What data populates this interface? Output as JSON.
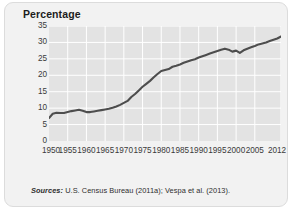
{
  "figure": {
    "title": "Percentage",
    "background_color": "#f2f2f2",
    "plot_background_color": "#e3e3e3",
    "gridline_color": "#ffffff",
    "line_color": "#4d4d4d"
  },
  "sources": {
    "label": "Sources:",
    "text": " U.S. Census Bureau (2011a); Vespa et al. (2013)."
  },
  "chart_data": {
    "type": "line",
    "title": "Percentage",
    "xlabel": "",
    "ylabel": "Percentage",
    "xlim": [
      1950,
      2012
    ],
    "ylim": [
      0,
      35
    ],
    "ytick_step": 5,
    "grid": true,
    "legend": "none",
    "ytick_labels": [
      "0",
      "5",
      "10",
      "15",
      "20",
      "25",
      "30",
      "35"
    ],
    "ytick_values": [
      0,
      5,
      10,
      15,
      20,
      25,
      30,
      35
    ],
    "xtick_labels": [
      "1950",
      "1955",
      "1960",
      "1965",
      "1970",
      "1975",
      "1980",
      "1985",
      "1990",
      "1995",
      "2000",
      "2005",
      "2012"
    ],
    "xtick_values": [
      1950,
      1955,
      1960,
      1965,
      1970,
      1975,
      1980,
      1985,
      1990,
      1995,
      2000,
      2005,
      2012
    ],
    "x": [
      1950,
      1951,
      1952,
      1953,
      1954,
      1955,
      1956,
      1957,
      1958,
      1959,
      1960,
      1961,
      1962,
      1963,
      1964,
      1965,
      1966,
      1967,
      1968,
      1969,
      1970,
      1971,
      1972,
      1973,
      1974,
      1975,
      1976,
      1977,
      1978,
      1979,
      1980,
      1981,
      1982,
      1983,
      1984,
      1985,
      1986,
      1987,
      1988,
      1989,
      1990,
      1991,
      1992,
      1993,
      1994,
      1995,
      1996,
      1997,
      1998,
      1999,
      2000,
      2001,
      2002,
      2003,
      2004,
      2005,
      2006,
      2007,
      2008,
      2009,
      2010,
      2011,
      2012
    ],
    "values": [
      7.0,
      8.3,
      8.6,
      8.5,
      8.5,
      8.8,
      9.1,
      9.3,
      9.5,
      9.2,
      8.8,
      8.8,
      9.0,
      9.2,
      9.4,
      9.6,
      9.8,
      10.1,
      10.5,
      11.0,
      11.6,
      12.2,
      13.4,
      14.3,
      15.4,
      16.5,
      17.4,
      18.3,
      19.4,
      20.4,
      21.3,
      21.6,
      21.9,
      22.6,
      22.9,
      23.3,
      23.8,
      24.2,
      24.6,
      24.9,
      25.4,
      25.8,
      26.2,
      26.6,
      27.0,
      27.4,
      27.8,
      28.1,
      27.8,
      27.2,
      27.5,
      26.8,
      27.6,
      28.1,
      28.5,
      28.9,
      29.4,
      29.7,
      30.0,
      30.4,
      30.8,
      31.2,
      31.8
    ]
  }
}
